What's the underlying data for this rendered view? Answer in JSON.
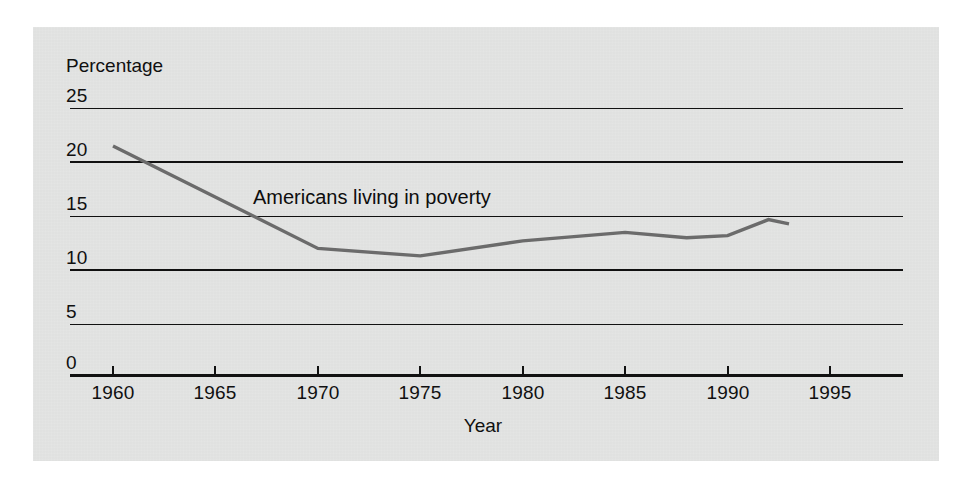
{
  "figure": {
    "background_color": "#ffffff",
    "panel_color": "#e3e4e3"
  },
  "chart_data": {
    "type": "line",
    "title": "",
    "xlabel": "Year",
    "ylabel": "Percentage",
    "xlim": [
      1958.5,
      1996.5
    ],
    "ylim": [
      0,
      25
    ],
    "grid": true,
    "legend_position": "inline-annotation",
    "x_ticks": [
      1960,
      1965,
      1970,
      1975,
      1980,
      1985,
      1990,
      1995
    ],
    "y_ticks": [
      0,
      5,
      10,
      15,
      20,
      25
    ],
    "annotations": [
      {
        "text": "Americans living in poverty",
        "x": 1970,
        "y": 16.5
      }
    ],
    "series": [
      {
        "name": "Americans living in poverty",
        "color": "#6b6b6b",
        "line_width": 3,
        "x": [
          1960,
          1970,
          1975,
          1980,
          1985,
          1988,
          1990,
          1992,
          1993
        ],
        "values": [
          21.5,
          11.9,
          11.2,
          12.6,
          13.4,
          12.9,
          13.1,
          14.6,
          14.2
        ]
      }
    ]
  },
  "axis": {
    "y_title": "Percentage",
    "x_title": "Year",
    "y_tick_labels": [
      "25",
      "20",
      "15",
      "10",
      "5",
      "0"
    ],
    "x_tick_labels": [
      "1960",
      "1965",
      "1970",
      "1975",
      "1980",
      "1985",
      "1990",
      "1995"
    ]
  },
  "colors": {
    "line": "#6b6b6b",
    "grid": "#111111",
    "text": "#101010"
  }
}
